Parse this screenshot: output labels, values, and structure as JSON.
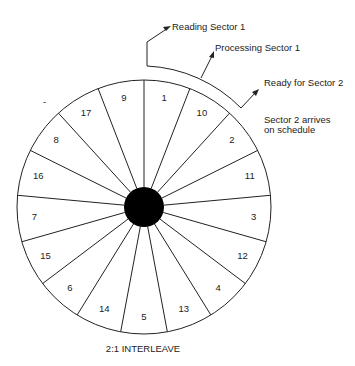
{
  "diagram": {
    "caption": "2:1 INTERLEAVE",
    "sector_order_clockwise_from_top": [
      "1",
      "10",
      "2",
      "11",
      "3",
      "12",
      "4",
      "13",
      "5",
      "14",
      "6",
      "15",
      "7",
      "16",
      "8",
      "17",
      "9"
    ],
    "annotations": {
      "reading": "Reading Sector 1",
      "processing": "Processing Sector 1",
      "ready": "Ready for Sector 2",
      "arrives_line1": "Sector 2 arrives",
      "arrives_line2": "on schedule"
    },
    "colors": {
      "line": "#222222",
      "hub": "#000000",
      "background": "#ffffff"
    }
  }
}
